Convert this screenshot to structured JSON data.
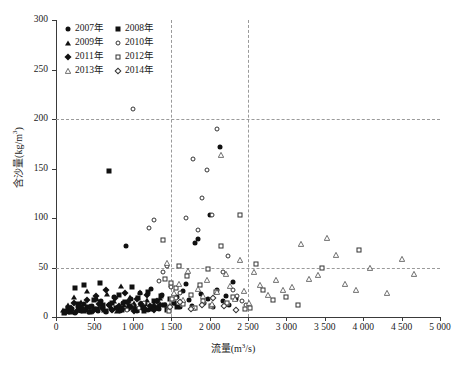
{
  "chart_data": {
    "type": "scatter",
    "title": "",
    "xlabel": "流量(m³/s)",
    "ylabel": "含沙量(kg/m³)",
    "xlim": [
      0,
      5000
    ],
    "ylim": [
      0,
      300
    ],
    "xticks": [
      0,
      500,
      1000,
      1500,
      2000,
      2500,
      3000,
      3500,
      4000,
      4500,
      5000
    ],
    "xticklabels": [
      "0",
      "500",
      "1 000",
      "1 500",
      "2 000",
      "2 500",
      "3 000",
      "3 500",
      "4 000",
      "4 500",
      "5 000"
    ],
    "yticks": [
      0,
      50,
      100,
      150,
      200,
      250,
      300
    ],
    "yticklabels": [
      "0",
      "50",
      "100",
      "150",
      "200",
      "250",
      "300"
    ],
    "grid": false,
    "reference_lines": {
      "horizontal": [
        50,
        200
      ],
      "vertical": [
        1500,
        2500
      ],
      "style": "dashed",
      "color": "#9a9a9a"
    },
    "legend_position": "upper-left",
    "series": [
      {
        "name": "2007年",
        "marker": "filled-circle",
        "points": [
          [
            120,
            6
          ],
          [
            175,
            5
          ],
          [
            210,
            8
          ],
          [
            250,
            4
          ],
          [
            290,
            10
          ],
          [
            330,
            6
          ],
          [
            360,
            13
          ],
          [
            395,
            7
          ],
          [
            430,
            5
          ],
          [
            470,
            11
          ],
          [
            505,
            8
          ],
          [
            545,
            6
          ],
          [
            580,
            16
          ],
          [
            615,
            9
          ],
          [
            650,
            5
          ],
          [
            690,
            12
          ],
          [
            725,
            7
          ],
          [
            760,
            20
          ],
          [
            800,
            9
          ],
          [
            835,
            6
          ],
          [
            870,
            14
          ],
          [
            905,
            72
          ],
          [
            940,
            8
          ],
          [
            980,
            18
          ],
          [
            1015,
            11
          ],
          [
            1050,
            6
          ],
          [
            1090,
            24
          ],
          [
            1125,
            9
          ],
          [
            1160,
            13
          ],
          [
            1200,
            7
          ],
          [
            1235,
            28
          ],
          [
            1270,
            10
          ],
          [
            1310,
            16
          ],
          [
            1345,
            8
          ],
          [
            1380,
            22
          ],
          [
            1420,
            12
          ],
          [
            1455,
            9
          ],
          [
            1495,
            31
          ],
          [
            1530,
            14
          ],
          [
            1570,
            20
          ],
          [
            1610,
            10
          ],
          [
            1650,
            26
          ],
          [
            1690,
            33
          ],
          [
            1730,
            17
          ],
          [
            1770,
            11
          ],
          [
            1810,
            75
          ],
          [
            1850,
            79
          ],
          [
            1890,
            23
          ],
          [
            1930,
            14
          ],
          [
            1975,
            18
          ],
          [
            2010,
            103
          ],
          [
            2050,
            10
          ],
          [
            2090,
            27
          ],
          [
            2130,
            172
          ],
          [
            2170,
            16
          ],
          [
            2215,
            21
          ],
          [
            2255,
            12
          ],
          [
            2300,
            35
          ],
          [
            2340,
            18
          ]
        ]
      },
      {
        "name": "2008年",
        "marker": "filled-square",
        "points": [
          [
            105,
            4
          ],
          [
            160,
            9
          ],
          [
            200,
            6
          ],
          [
            245,
            29
          ],
          [
            285,
            13
          ],
          [
            320,
            7
          ],
          [
            365,
            32
          ],
          [
            405,
            10
          ],
          [
            445,
            5
          ],
          [
            490,
            17
          ],
          [
            530,
            8
          ],
          [
            570,
            34
          ],
          [
            610,
            12
          ],
          [
            655,
            6
          ],
          [
            695,
            147
          ],
          [
            735,
            14
          ],
          [
            775,
            9
          ],
          [
            820,
            22
          ],
          [
            860,
            7
          ],
          [
            900,
            15
          ],
          [
            945,
            11
          ],
          [
            985,
            30
          ],
          [
            1025,
            8
          ],
          [
            1070,
            19
          ],
          [
            1110,
            13
          ],
          [
            1150,
            6
          ],
          [
            1195,
            25
          ],
          [
            1235,
            10
          ],
          [
            1280,
            16
          ],
          [
            1320,
            9
          ],
          [
            1365,
            21
          ],
          [
            1405,
            12
          ],
          [
            1450,
            7
          ],
          [
            1490,
            18
          ],
          [
            1535,
            14
          ],
          [
            1575,
            10
          ]
        ]
      },
      {
        "name": "2009年",
        "marker": "filled-triangle",
        "points": [
          [
            95,
            7
          ],
          [
            150,
            12
          ],
          [
            195,
            5
          ],
          [
            240,
            20
          ],
          [
            280,
            9
          ],
          [
            325,
            15
          ],
          [
            370,
            6
          ],
          [
            410,
            26
          ],
          [
            455,
            11
          ],
          [
            500,
            8
          ],
          [
            540,
            18
          ],
          [
            585,
            13
          ],
          [
            625,
            7
          ],
          [
            670,
            23
          ],
          [
            710,
            10
          ],
          [
            755,
            16
          ],
          [
            800,
            6
          ],
          [
            840,
            31
          ],
          [
            885,
            12
          ],
          [
            930,
            9
          ],
          [
            970,
            20
          ],
          [
            1015,
            14
          ],
          [
            1060,
            7
          ],
          [
            1100,
            25
          ],
          [
            1145,
            11
          ],
          [
            1190,
            17
          ],
          [
            1230,
            8
          ],
          [
            1275,
            13
          ],
          [
            1320,
            10
          ],
          [
            1360,
            19
          ]
        ]
      },
      {
        "name": "2010年",
        "marker": "open-circle",
        "points": [
          [
            1000,
            210
          ],
          [
            1215,
            90
          ],
          [
            1270,
            98
          ],
          [
            1345,
            36
          ],
          [
            1390,
            45
          ],
          [
            1440,
            52
          ],
          [
            1500,
            30
          ],
          [
            1560,
            19
          ],
          [
            1620,
            24
          ],
          [
            1690,
            100
          ],
          [
            1790,
            160
          ],
          [
            1850,
            88
          ],
          [
            1905,
            120
          ],
          [
            1960,
            148
          ],
          [
            2030,
            103
          ],
          [
            2100,
            190
          ],
          [
            2175,
            45
          ],
          [
            2240,
            62
          ],
          [
            2305,
            27
          ],
          [
            2360,
            21
          ],
          [
            2420,
            16
          ],
          [
            2470,
            12
          ],
          [
            1150,
            14
          ],
          [
            1080,
            9
          ],
          [
            990,
            11
          ],
          [
            930,
            7
          ]
        ]
      },
      {
        "name": "2011年",
        "marker": "filled-diamond",
        "points": [
          [
            135,
            5
          ],
          [
            190,
            9
          ],
          [
            235,
            14
          ],
          [
            275,
            6
          ],
          [
            315,
            11
          ],
          [
            355,
            8
          ],
          [
            400,
            17
          ],
          [
            440,
            10
          ],
          [
            485,
            6
          ],
          [
            525,
            21
          ],
          [
            565,
            13
          ],
          [
            605,
            9
          ],
          [
            645,
            27
          ],
          [
            685,
            12
          ],
          [
            730,
            7
          ],
          [
            770,
            19
          ],
          [
            815,
            11
          ],
          [
            855,
            8
          ],
          [
            895,
            24
          ],
          [
            935,
            15
          ],
          [
            975,
            10
          ],
          [
            1020,
            6
          ],
          [
            1060,
            18
          ],
          [
            1105,
            13
          ],
          [
            1145,
            9
          ],
          [
            1185,
            22
          ],
          [
            1225,
            11
          ],
          [
            1270,
            7
          ],
          [
            1315,
            16
          ],
          [
            1355,
            12
          ]
        ]
      },
      {
        "name": "2012年",
        "marker": "open-square",
        "points": [
          [
            1395,
            78
          ],
          [
            1420,
            38
          ],
          [
            1470,
            6
          ],
          [
            1500,
            34
          ],
          [
            1510,
            18
          ],
          [
            1560,
            29
          ],
          [
            1600,
            52
          ],
          [
            1650,
            13
          ],
          [
            1700,
            41
          ],
          [
            1760,
            22
          ],
          [
            1810,
            9
          ],
          [
            1870,
            32
          ],
          [
            1920,
            16
          ],
          [
            1980,
            48
          ],
          [
            2020,
            11
          ],
          [
            2080,
            25
          ],
          [
            2150,
            72
          ],
          [
            2230,
            14
          ],
          [
            2310,
            20
          ],
          [
            2390,
            103
          ],
          [
            2460,
            8
          ],
          [
            2520,
            9
          ],
          [
            2600,
            54
          ],
          [
            2700,
            27
          ],
          [
            2830,
            17
          ],
          [
            3000,
            20
          ],
          [
            3150,
            12
          ],
          [
            3470,
            49
          ],
          [
            3950,
            68
          ]
        ]
      },
      {
        "name": "2013年",
        "marker": "open-triangle",
        "points": [
          [
            1440,
            55
          ],
          [
            1490,
            12
          ],
          [
            1540,
            24
          ],
          [
            1600,
            33
          ],
          [
            1660,
            17
          ],
          [
            1720,
            46
          ],
          [
            1790,
            9
          ],
          [
            1850,
            28
          ],
          [
            1910,
            21
          ],
          [
            1970,
            37
          ],
          [
            2030,
            13
          ],
          [
            2090,
            25
          ],
          [
            2150,
            164
          ],
          [
            2210,
            43
          ],
          [
            2270,
            31
          ],
          [
            2330,
            18
          ],
          [
            2390,
            58
          ],
          [
            2450,
            26
          ],
          [
            2510,
            14
          ],
          [
            2580,
            45
          ],
          [
            2660,
            32
          ],
          [
            2760,
            22
          ],
          [
            2860,
            37
          ],
          [
            2960,
            27
          ],
          [
            3070,
            30
          ],
          [
            3190,
            74
          ],
          [
            3290,
            38
          ],
          [
            3410,
            42
          ],
          [
            3530,
            80
          ],
          [
            3640,
            63
          ],
          [
            3760,
            33
          ],
          [
            3900,
            27
          ],
          [
            4090,
            50
          ],
          [
            4310,
            24
          ],
          [
            4510,
            59
          ],
          [
            4660,
            43
          ]
        ]
      },
      {
        "name": "2014年",
        "marker": "open-diamond",
        "points": [
          [
            1480,
            10
          ],
          [
            1620,
            15
          ],
          [
            1760,
            8
          ],
          [
            1900,
            12
          ],
          [
            2050,
            19
          ],
          [
            2190,
            11
          ],
          [
            2340,
            7
          ]
        ]
      }
    ]
  },
  "legend": {
    "items": [
      {
        "label": "2007年",
        "marker": "filled-circle"
      },
      {
        "label": "2008年",
        "marker": "filled-square"
      },
      {
        "label": "2009年",
        "marker": "filled-triangle"
      },
      {
        "label": "2010年",
        "marker": "open-circle"
      },
      {
        "label": "2011年",
        "marker": "filled-diamond"
      },
      {
        "label": "2012年",
        "marker": "open-square"
      },
      {
        "label": "2013年",
        "marker": "open-triangle"
      },
      {
        "label": "2014年",
        "marker": "open-diamond"
      }
    ]
  },
  "colors": {
    "marker": "#111111",
    "axis": "#3a3a3a",
    "reference_line": "#9a9a9a",
    "background": "#ffffff"
  }
}
